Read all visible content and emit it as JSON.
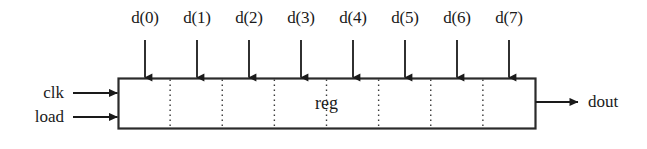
{
  "diagram": {
    "block": {
      "label": "reg",
      "x": 118,
      "y": 78,
      "width": 417,
      "height": 50,
      "border_color": "#2b2b2b",
      "fill_color": "#ffffff",
      "cell_count": 8,
      "divider_style": "dotted"
    },
    "data_inputs": [
      {
        "label": "d(0)",
        "x": 145
      },
      {
        "label": "d(1)",
        "x": 197
      },
      {
        "label": "d(2)",
        "x": 249
      },
      {
        "label": "d(3)",
        "x": 301
      },
      {
        "label": "d(4)",
        "x": 353
      },
      {
        "label": "d(5)",
        "x": 405
      },
      {
        "label": "d(6)",
        "x": 457
      },
      {
        "label": "d(7)",
        "x": 509
      }
    ],
    "control_inputs": [
      {
        "label": "clk",
        "y": 93
      },
      {
        "label": "load",
        "y": 117
      }
    ],
    "outputs": [
      {
        "label": "dout",
        "y": 102
      }
    ],
    "arrow_color": "#1a1a1a",
    "label_color": "#1a1a1a",
    "input_arrow_top": 40,
    "label_baseline_y": 22
  }
}
